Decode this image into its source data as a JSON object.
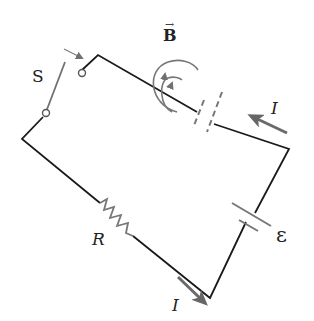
{
  "diagram": {
    "type": "circuit",
    "labels": {
      "switch": "S",
      "magnetic_field": "B",
      "current_top": "I",
      "current_bottom": "I",
      "resistor": "R",
      "emf": "ε"
    },
    "components": [
      "switch S",
      "capacitor (gap, dashed plates)",
      "battery ε",
      "resistor R"
    ],
    "colors": {
      "wire": "#1a1a1a",
      "component": "#777777",
      "arrow": "#6a6a6a"
    }
  }
}
